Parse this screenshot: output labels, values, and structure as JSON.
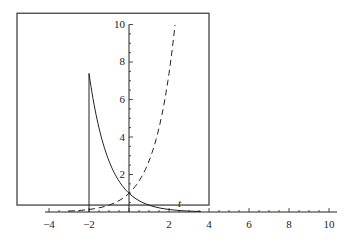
{
  "chart_data": {
    "type": "line",
    "title": "",
    "xlabel": "t",
    "ylabel": "",
    "xlim": [
      -4.5,
      10.5
    ],
    "ylim": [
      -0.5,
      10
    ],
    "x_ticks": [
      -4,
      -2,
      2,
      4,
      6,
      8,
      10
    ],
    "x_tick_labels": [
      "−4",
      "−2",
      "2",
      "4",
      "6",
      "8",
      "10"
    ],
    "y_ticks": [
      2,
      4,
      6,
      8,
      10
    ],
    "y_tick_labels": [
      "2",
      "4",
      "6",
      "8",
      "10"
    ],
    "grid": false,
    "legend": null,
    "frame": {
      "x_from": -5.6,
      "x_to": 4.0,
      "y_from": 0.37,
      "y_to": 10.6
    },
    "series": [
      {
        "name": "exp(-t) for t >= -2",
        "style": "solid",
        "color": "#222222",
        "x": [
          -2,
          -1.5,
          -1,
          -0.5,
          0,
          0.5,
          1,
          1.5,
          2,
          2.5,
          3,
          3.5
        ],
        "values": [
          7.39,
          4.48,
          2.72,
          1.65,
          1.0,
          0.61,
          0.37,
          0.22,
          0.14,
          0.08,
          0.05,
          0.03
        ]
      },
      {
        "name": "vertical line at t = -2",
        "style": "solid",
        "color": "#222222",
        "x": [
          -2,
          -2
        ],
        "values": [
          0,
          7.39
        ]
      },
      {
        "name": "exp(t)",
        "style": "dashed",
        "color": "#222222",
        "x": [
          -3,
          -2.5,
          -2,
          -1.5,
          -1,
          -0.5,
          0,
          0.5,
          1,
          1.5,
          2,
          2.3
        ],
        "values": [
          0.05,
          0.08,
          0.14,
          0.22,
          0.37,
          0.61,
          1.0,
          1.65,
          2.72,
          4.48,
          7.39,
          9.97
        ]
      }
    ],
    "annotations": [
      {
        "text": "t",
        "x": 2.5,
        "y": 0.4
      }
    ]
  },
  "labels": {
    "x_axis_var": "t",
    "xticks": [
      "−4",
      "−2",
      "2",
      "4",
      "6",
      "8",
      "10"
    ],
    "yticks": [
      "2",
      "4",
      "6",
      "8",
      "10"
    ]
  }
}
